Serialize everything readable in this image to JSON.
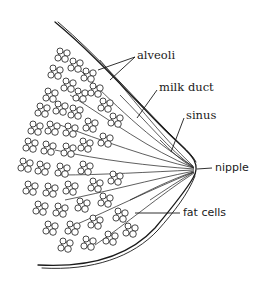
{
  "diagram": {
    "labels": {
      "alveoli": "alveoli",
      "milk_duct": "milk duct",
      "sinus": "sinus",
      "nipple": "nipple",
      "fat_cells": "fat cells"
    },
    "colors": {
      "ink": "#1a1a1a",
      "background": "#ffffff"
    }
  }
}
